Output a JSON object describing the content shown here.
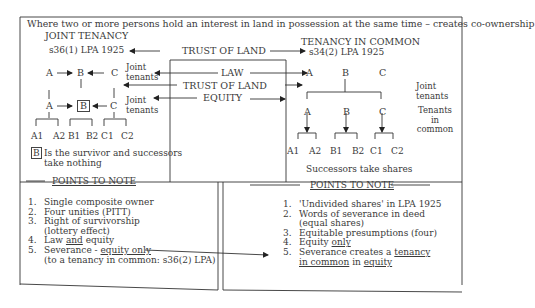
{
  "header": "Where two or more persons hold an interest in land in possession at the same time – creates co-ownership",
  "joint_tenancy": {
    "title": "JOINT TENANCY",
    "statute": "s36(1) LPA 1925",
    "row1": [
      "A",
      "B",
      "C"
    ],
    "row2": [
      "A",
      "B",
      "C"
    ],
    "label_law": "Joint tenants",
    "label_equity": "Joint tenants",
    "successors": [
      "A1",
      "A2",
      "B1",
      "B2",
      "C1",
      "C2"
    ],
    "survivor_box": "B",
    "survivor_note_line1": "Is the survivor and successors",
    "survivor_note_line2": "take nothing",
    "points_title": "POINTS TO NOTE",
    "points": [
      {
        "n": "1.",
        "text": "Single composite owner"
      },
      {
        "n": "2.",
        "text": "Four unities (PITT)"
      },
      {
        "n": "3.",
        "text": "Right of survivorship",
        "cont": "(lottery effect)"
      },
      {
        "n": "4.",
        "pre": "Law ",
        "u": "and",
        "post": " equity"
      },
      {
        "n": "5.",
        "pre": "Severance - ",
        "u": "equity only",
        "cont": "(to a tenancy in common: s36(2) LPA)"
      }
    ]
  },
  "tenancy_in_common": {
    "title": "TENANCY IN COMMON",
    "statute": "s34(2) LPA 1925",
    "row1": [
      "A",
      "B",
      "C"
    ],
    "row2": [
      "A",
      "B",
      "C"
    ],
    "label_law": "Joint tenants",
    "label_equity": "Tenants in common",
    "successors": [
      "A1",
      "A2",
      "B1",
      "B2",
      "C1",
      "C2"
    ],
    "successor_note": "Successors take shares",
    "points_title": "POINTS TO NOTE",
    "points": [
      {
        "n": "1.",
        "text": "'Undivided shares' in LPA 1925"
      },
      {
        "n": "2.",
        "text": "Words of severance in deed",
        "cont": "(equal shares)"
      },
      {
        "n": "3.",
        "text": "Equitable presumptions (four)"
      },
      {
        "n": "4.",
        "pre": "Equity ",
        "u": "only"
      },
      {
        "n": "5.",
        "pre": "Severance creates a ",
        "u": "tenancy",
        "cont_u": "in common",
        "cont_mid": " in ",
        "cont_u2": "equity"
      }
    ]
  },
  "center": {
    "trust_top": "TRUST OF LAND",
    "law": "LAW",
    "trust_mid": "TRUST OF LAND",
    "equity": "EQUITY"
  }
}
